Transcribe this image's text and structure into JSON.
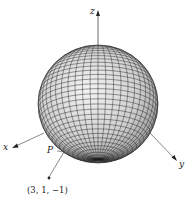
{
  "figure": {
    "type": "sphere-with-axes",
    "axes": {
      "x": {
        "label": "x"
      },
      "y": {
        "label": "y"
      },
      "z": {
        "label": "z"
      }
    },
    "point_on_surface": {
      "label": "P"
    },
    "external_point": {
      "label": "(3, 1, −1)"
    },
    "colors": {
      "mesh": "#1a1a1a",
      "sphere_light": "#f2f2f2",
      "sphere_dark": "#8a8a8a",
      "axis": "#555555"
    }
  }
}
